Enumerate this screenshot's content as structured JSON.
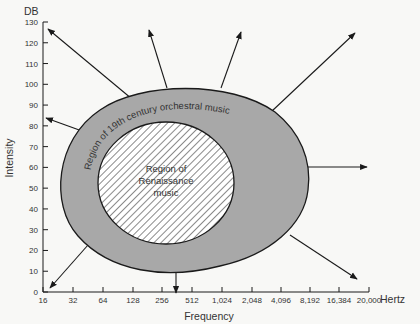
{
  "chart_data": {
    "type": "diagram",
    "title": "",
    "y_axis": {
      "unit": "DB",
      "label": "Intensity",
      "ticks": [
        "0",
        "10",
        "20",
        "30",
        "40",
        "50",
        "60",
        "70",
        "80",
        "90",
        "100",
        "110",
        "120",
        "130"
      ],
      "range": [
        0,
        130
      ]
    },
    "x_axis": {
      "unit": "Hertz",
      "label": "Frequency",
      "ticks": [
        "16",
        "32",
        "64",
        "128",
        "256",
        "512",
        "1,024",
        "2,048",
        "4,096",
        "8,192",
        "16,384",
        "20,000"
      ],
      "scale": "log2"
    },
    "regions": [
      {
        "name": "outer",
        "label": "Region of 19th century orchestral music",
        "fill": "#a8a8a8",
        "pattern": "solid"
      },
      {
        "name": "inner",
        "label_lines": [
          "Region of",
          "Renaissance",
          "music"
        ],
        "fill": "#ffffff",
        "pattern": "diagonal-hatch"
      }
    ],
    "arrows": {
      "count": 9,
      "meaning": "outward expansion of range",
      "directions": [
        "up-left",
        "left",
        "down-left",
        "down",
        "down-right",
        "right",
        "up-right",
        "up",
        "up-slight-left"
      ]
    },
    "colors": {
      "background": "#f8f8f6",
      "outer_region": "#a8a8a8",
      "outline": "#1a1a1a",
      "hatch": "#8a8a8a"
    }
  }
}
